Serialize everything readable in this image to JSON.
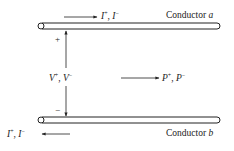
{
  "diagram": {
    "conductor_a": {
      "label_prefix": "Conductor ",
      "label_letter": "a"
    },
    "conductor_b": {
      "label_prefix": "Conductor ",
      "label_letter": "b"
    },
    "current_top": {
      "text_1": "I",
      "sup_1": "+",
      "sep": ", ",
      "text_2": "I",
      "sup_2": "−"
    },
    "current_bottom": {
      "text_1": "I",
      "sup_1": "+",
      "sep": ", ",
      "text_2": "I",
      "sup_2": "−"
    },
    "voltage": {
      "text_1": "V",
      "sup_1": "+",
      "sep": ", ",
      "text_2": "V",
      "sup_2": "−",
      "plus": "+",
      "minus": "−"
    },
    "power": {
      "text_1": "P",
      "sup_1": "+",
      "sep": ", ",
      "text_2": "P",
      "sup_2": "−"
    },
    "colors": {
      "line": "#222222",
      "background": "#ffffff"
    }
  }
}
